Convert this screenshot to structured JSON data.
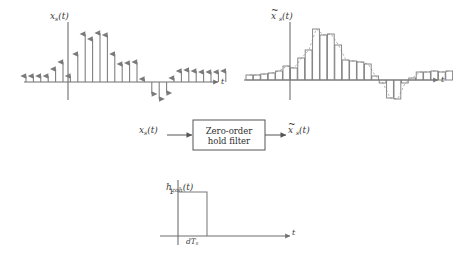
{
  "figure": {
    "title_present": false,
    "background": "#ffffff",
    "ink": "#6f6f6f",
    "text_color": "#3a3a3a"
  },
  "panels": {
    "sampled_signal": {
      "name": "sampled-signal-plot",
      "y_label": "x",
      "y_label_sub": "s",
      "y_label_arg": "(t)",
      "x_label": "t",
      "axis_origin": {
        "x": 68,
        "y": 82
      },
      "axis_x_end": 218,
      "axis_y_top": 22,
      "axis_y_bottom": 100,
      "sample_spacing": 7.4,
      "chart_data": {
        "type": "stem",
        "title": "x_s(t)",
        "xlabel": "t",
        "ylabel": "x_s(t)",
        "grid": false,
        "ylim": [
          -20,
          62
        ],
        "x_start_px": 26,
        "values": [
          6,
          6,
          6,
          6,
          13,
          20,
          6,
          28,
          48,
          43,
          49,
          47,
          28,
          18,
          19,
          20,
          3,
          -12,
          -17,
          -11,
          4,
          11,
          12,
          11,
          10,
          10,
          10,
          11
        ]
      }
    },
    "zoh_output_signal": {
      "name": "zoh-output-plot",
      "y_label": "x",
      "y_label_tilde": true,
      "y_label_sub": "s",
      "y_label_arg": "(t)",
      "x_label": "t",
      "axis_origin": {
        "x": 290,
        "y": 80
      },
      "axis_x_end": 438,
      "axis_y_top": 22,
      "axis_y_bottom": 100,
      "bar_width": 7.4,
      "chart_data": {
        "type": "bar",
        "title": "x̃_s(t)",
        "xlabel": "t",
        "ylabel": "x̃_s(t)",
        "grid": false,
        "ylim": [
          -22,
          60
        ],
        "x_start_px": 246,
        "envelope": "dashed",
        "values": [
          5,
          5,
          6,
          7,
          9,
          14,
          12,
          22,
          30,
          51,
          45,
          46,
          35,
          20,
          19,
          18,
          16,
          4,
          -3,
          -18,
          -19,
          -3,
          2,
          8,
          8,
          9,
          8,
          9
        ]
      }
    },
    "impulse_response": {
      "name": "impulse-response-plot",
      "y_label": "h",
      "y_label_sub": "zoh",
      "y_label_arg": "(t)",
      "x_label": "t",
      "amplitude_label": "1",
      "width_label": "dT",
      "width_label_sub": "s",
      "axis_origin": {
        "x": 178,
        "y": 236
      },
      "axis_x_end": 290,
      "axis_y_top": 180,
      "pulse_start_px": 178,
      "pulse_end_px": 207,
      "pulse_height_px": 44
    }
  },
  "block_diagram": {
    "name": "zero-order-hold-block-diagram",
    "input_label": "x",
    "input_label_sub": "s",
    "input_label_arg": "(t)",
    "output_label": "x",
    "output_label_tilde": true,
    "output_label_sub": "s",
    "output_label_arg": "(t)",
    "block_line1": "Zero-order",
    "block_line2": "hold filter",
    "block_rect": {
      "x": 193,
      "y": 120,
      "width": 72,
      "height": 30
    }
  }
}
